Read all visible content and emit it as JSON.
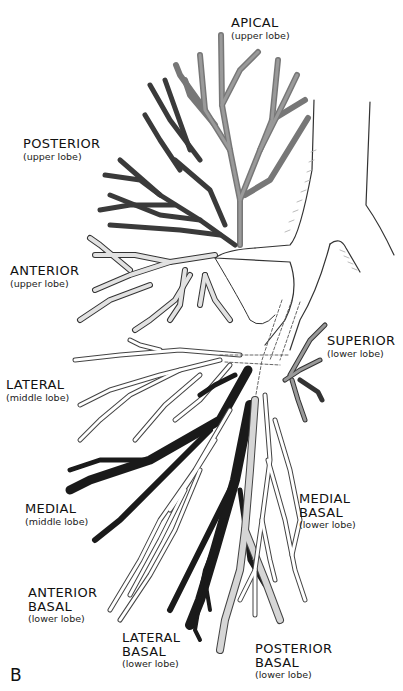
{
  "figure": {
    "panel_letter": "B",
    "ghost_text": [
      "",
      ""
    ],
    "colors": {
      "upper_apical": "#8a8a8a",
      "posterior_upper": "#4a4a4a",
      "anterior_upper": "#d8d8d8",
      "middle_medial": "#1a1a1a",
      "lateral_basal": "#222222",
      "medial_basal": "#d0d0d0",
      "outline": "#333333"
    }
  },
  "labels": [
    {
      "id": "apical",
      "name": "APICAL",
      "sub": "(upper lobe)"
    },
    {
      "id": "posterior",
      "name": "POSTERIOR",
      "sub": "(upper lobe)"
    },
    {
      "id": "anterior",
      "name": "ANTERIOR",
      "sub": "(upper lobe)"
    },
    {
      "id": "superior",
      "name": "SUPERIOR",
      "sub": "(lower lobe)"
    },
    {
      "id": "lateral",
      "name": "LATERAL",
      "sub": "(middle lobe)"
    },
    {
      "id": "medial",
      "name": "MEDIAL",
      "sub": "(middle lobe)"
    },
    {
      "id": "medial-basal",
      "name": "MEDIAL",
      "name2": "BASAL",
      "sub": "(lower lobe)"
    },
    {
      "id": "anterior-basal",
      "name": "ANTERIOR",
      "name2": "BASAL",
      "sub": "(lower lobe)"
    },
    {
      "id": "lateral-basal",
      "name": "LATERAL",
      "name2": "BASAL",
      "sub": "(lower lobe)"
    },
    {
      "id": "posterior-basal",
      "name": "POSTERIOR",
      "name2": "BASAL",
      "sub": "(lower lobe)"
    }
  ]
}
